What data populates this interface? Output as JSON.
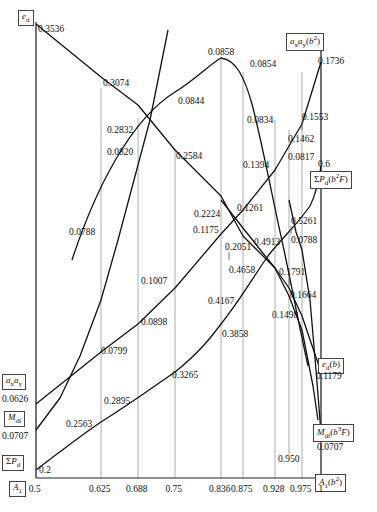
{
  "chart_data": {
    "type": "line",
    "title": "",
    "xlabel": "A_1",
    "ylabel": "",
    "grid": true,
    "legend": "none",
    "x_ticks": [
      "0.5",
      "0.625",
      "0.688",
      "0.75",
      "0.836",
      "0.875",
      "0.928",
      "0.975",
      "1"
    ],
    "x_tick_values": [
      0.5,
      0.625,
      0.688,
      0.75,
      0.836,
      0.875,
      0.928,
      0.975,
      1.0
    ],
    "axis_labels_left": [
      {
        "name": "e_d",
        "text_html": "<i>e</i><sub>d</sub>",
        "value": "0.3536"
      },
      {
        "name": "ax-ay",
        "text_html": "<i>a</i><sub>x</sub><i>a</i><sub>y</sub>",
        "value": "0.0626"
      },
      {
        "name": "Mdf",
        "text_html": "<i>M</i><sub>df</sub>",
        "value": "0.0707"
      },
      {
        "name": "sum-Pd",
        "text_html": "&Sigma;<i>P</i><sub>d</sub>",
        "value": "0.2"
      },
      {
        "name": "A1",
        "text_html": "<i>A</i><sub>1</sub>",
        "value": "0.5"
      }
    ],
    "axis_labels_right": [
      {
        "name": "ax-ay-b2",
        "text_html": "<i>a</i><sub>x</sub><i>a</i><sub>y</sub>(<i>b</i><sup>2</sup>)",
        "value": "0.1736"
      },
      {
        "name": "sum-Pd-b2F",
        "text_html": "&Sigma;<i>P</i><sub>d</sub>(<i>b</i><sup>2</sup><i>F</i>)",
        "value": "0.6"
      },
      {
        "name": "ed-b",
        "text_html": "<i>e</i><sub>d</sub>(<i>b</i>)",
        "value": "0.1179"
      },
      {
        "name": "Mdf-b3F",
        "text_html": "<i>M</i><sub>df</sub>(<i>b</i><sup>3</sup><i>F</i>)",
        "value": "0.0707"
      },
      {
        "name": "A1-b2",
        "text_html": "<i>A</i><sub>1</sub>(<i>b</i><sup>2</sup>)",
        "value": ""
      }
    ],
    "series": [
      {
        "name": "e_d descending",
        "values": [
          "0.3536",
          "0.3074",
          "0.2832",
          "0.2584",
          "0.2224",
          "0.2051",
          "0.1791",
          "0.1664",
          "0.1498"
        ]
      },
      {
        "name": "a_x a_y arch",
        "values": [
          "0.0788",
          "0.0820",
          "0.0844",
          "0.0858",
          "0.0854",
          "0.0834",
          "0.0817"
        ]
      },
      {
        "name": "a_x a_y ascending (b2)",
        "values": [
          "0.0626",
          "0.0799",
          "0.0898",
          "0.1007",
          "0.1175",
          "0.1261",
          "0.1394",
          "0.1462",
          "0.1553",
          "0.1736"
        ]
      },
      {
        "name": "Sum P_d ascending",
        "values": [
          "0.2",
          "0.2563",
          "0.2895",
          "0.3265",
          "0.3858",
          "0.4167",
          "0.4658",
          "0.4913",
          "0.5261",
          "0.6"
        ]
      },
      {
        "name": "M_df flat/descend",
        "values": [
          "0.0707",
          "0.0788",
          "0.0707"
        ]
      }
    ],
    "point_labels": [
      {
        "text": "0.3536",
        "x": 38,
        "y": 25,
        "series": "e_d"
      },
      {
        "text": "0.3074",
        "x": 103,
        "y": 79,
        "series": "e_d"
      },
      {
        "text": "0.2832",
        "x": 107,
        "y": 126,
        "series": "e_d"
      },
      {
        "text": "0.2584",
        "x": 176,
        "y": 152,
        "series": "e_d"
      },
      {
        "text": "0.2224",
        "x": 194,
        "y": 210,
        "series": "e_d"
      },
      {
        "text": "0.2051",
        "x": 225,
        "y": 243,
        "series": "e_d"
      },
      {
        "text": "0.1791",
        "x": 279,
        "y": 268,
        "series": "e_d"
      },
      {
        "text": "0.1664",
        "x": 290,
        "y": 291,
        "series": "e_d"
      },
      {
        "text": "0.1498",
        "x": 272,
        "y": 311,
        "series": "e_d"
      },
      {
        "text": "0.1179",
        "x": 316,
        "y": 372,
        "series": "e_d(b)"
      },
      {
        "text": "0.0788",
        "x": 69,
        "y": 228,
        "series": "arch"
      },
      {
        "text": "0.0820",
        "x": 107,
        "y": 148,
        "series": "arch"
      },
      {
        "text": "0.0844",
        "x": 178,
        "y": 97,
        "series": "arch"
      },
      {
        "text": "0.0858",
        "x": 208,
        "y": 48,
        "series": "arch"
      },
      {
        "text": "0.0854",
        "x": 250,
        "y": 60,
        "series": "arch"
      },
      {
        "text": "0.0834",
        "x": 247,
        "y": 116,
        "series": "arch"
      },
      {
        "text": "0.0817",
        "x": 288,
        "y": 153,
        "series": "arch"
      },
      {
        "text": "0.0626",
        "x": 2,
        "y": 395,
        "series": "ax-ay"
      },
      {
        "text": "0.0799",
        "x": 101,
        "y": 347,
        "series": "ax-ay"
      },
      {
        "text": "0.0898",
        "x": 141,
        "y": 318,
        "series": "ax-ay"
      },
      {
        "text": "0.1007",
        "x": 141,
        "y": 277,
        "series": "ax-ay"
      },
      {
        "text": "0.1175",
        "x": 193,
        "y": 226,
        "series": "ax-ay"
      },
      {
        "text": "0.1261",
        "x": 237,
        "y": 204,
        "series": "ax-ay"
      },
      {
        "text": "0.1394",
        "x": 243,
        "y": 161,
        "series": "ax-ay"
      },
      {
        "text": "0.1462",
        "x": 288,
        "y": 135,
        "series": "ax-ay"
      },
      {
        "text": "0.1553",
        "x": 302,
        "y": 113,
        "series": "ax-ay"
      },
      {
        "text": "0.1736",
        "x": 318,
        "y": 57,
        "series": "ax-ay"
      },
      {
        "text": "0.2",
        "x": 39,
        "y": 466,
        "series": "sum-Pd"
      },
      {
        "text": "0.2563",
        "x": 66,
        "y": 420,
        "series": "sum-Pd"
      },
      {
        "text": "0.2895",
        "x": 104,
        "y": 397,
        "series": "sum-Pd"
      },
      {
        "text": "0.3265",
        "x": 172,
        "y": 371,
        "series": "sum-Pd"
      },
      {
        "text": "0.3858",
        "x": 222,
        "y": 330,
        "series": "sum-Pd"
      },
      {
        "text": "0.4167",
        "x": 208,
        "y": 297,
        "series": "sum-Pd"
      },
      {
        "text": "0.4658",
        "x": 229,
        "y": 266,
        "series": "sum-Pd"
      },
      {
        "text": "0.4913",
        "x": 254,
        "y": 238,
        "series": "sum-Pd"
      },
      {
        "text": "0.5261",
        "x": 291,
        "y": 217,
        "series": "sum-Pd"
      },
      {
        "text": "0.6",
        "x": 318,
        "y": 160,
        "series": "sum-Pd"
      },
      {
        "text": "0.0707",
        "x": 2,
        "y": 432,
        "series": "Mdf"
      },
      {
        "text": "0.0788",
        "x": 291,
        "y": 236,
        "series": "Mdf"
      },
      {
        "text": "0.0707",
        "x": 317,
        "y": 443,
        "series": "Mdf"
      },
      {
        "text": "0.950",
        "x": 278,
        "y": 455,
        "series": "A1"
      }
    ]
  },
  "axis": {
    "ticks": [
      "0.5",
      "0.625",
      "0.688",
      "0.75",
      "0.836",
      "0.875",
      "0.928",
      "0.975",
      "1"
    ]
  },
  "boxes": {
    "ed": "e_d",
    "ax_ay": "a_x a_y",
    "mdf": "M_df",
    "sum_pd": "Sum P_d",
    "a1": "A_1",
    "ax_ay_b2": "a_x a_y (b^2)",
    "sum_pd_b2f": "Sum P_d (b^2 F)",
    "ed_b": "e_d (b)",
    "mdf_b3f": "M_df (b^3 F)",
    "a1_b2": "A_1 (b^2)"
  },
  "colors": {
    "curve": "#111111",
    "grid": "#8a8a8a",
    "frame": "#222222",
    "box_border": "#444444",
    "background": "#ffffff"
  }
}
